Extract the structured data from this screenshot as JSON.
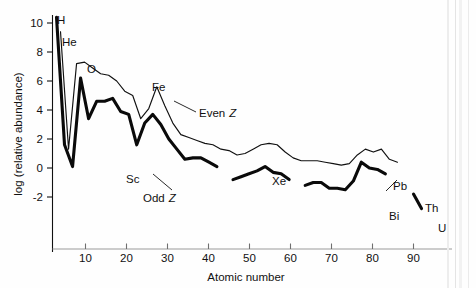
{
  "figure": {
    "name": "element-abundance-chart",
    "background_color": "#fefefe",
    "ink_color": "#111111"
  },
  "chart_data": {
    "type": "line",
    "title": "",
    "xlabel": "Atomic number",
    "ylabel": "log (relative abundance)",
    "xlim": [
      0,
      95
    ],
    "ylim": [
      -3.2,
      11.2
    ],
    "xticks": [
      10,
      20,
      30,
      40,
      50,
      60,
      70,
      80,
      90
    ],
    "xtick_labels": [
      "10",
      "20",
      "30",
      "40",
      "50",
      "60",
      "70",
      "80",
      "90"
    ],
    "yticks": [
      -2,
      0,
      2,
      4,
      6,
      8,
      10
    ],
    "ytick_labels": [
      "-2",
      "0",
      "2",
      "4",
      "6",
      "8",
      "10"
    ],
    "grid": false,
    "legend_position": "inline-annotations",
    "series": [
      {
        "name": "Even Z",
        "style": "thin",
        "points": [
          [
            2,
            9.4
          ],
          [
            4,
            1.3
          ],
          [
            6,
            7.2
          ],
          [
            8,
            7.3
          ],
          [
            10,
            6.9
          ],
          [
            12,
            6.5
          ],
          [
            14,
            6.4
          ],
          [
            16,
            6.0
          ],
          [
            18,
            5.3
          ],
          [
            20,
            5.0
          ],
          [
            22,
            3.4
          ],
          [
            24,
            4.1
          ],
          [
            26,
            5.6
          ],
          [
            28,
            4.3
          ],
          [
            30,
            3.1
          ],
          [
            32,
            2.3
          ],
          [
            34,
            2.1
          ],
          [
            36,
            1.9
          ],
          [
            38,
            1.7
          ],
          [
            40,
            1.6
          ],
          [
            42,
            1.3
          ],
          [
            44,
            1.2
          ],
          [
            46,
            0.9
          ],
          [
            48,
            1.0
          ],
          [
            50,
            1.3
          ],
          [
            52,
            1.6
          ],
          [
            54,
            1.7
          ],
          [
            56,
            1.6
          ],
          [
            58,
            1.1
          ],
          [
            60,
            0.7
          ],
          [
            62,
            0.5
          ],
          [
            64,
            0.5
          ],
          [
            66,
            0.5
          ],
          [
            68,
            0.4
          ],
          [
            70,
            0.3
          ],
          [
            72,
            0.2
          ],
          [
            74,
            0.3
          ],
          [
            76,
            0.9
          ],
          [
            78,
            1.3
          ],
          [
            80,
            1.1
          ],
          [
            82,
            1.3
          ],
          [
            84,
            0.6
          ],
          [
            86,
            0.4
          ]
        ]
      },
      {
        "name": "Odd Z",
        "style": "thick",
        "segments": [
          [
            [
              1,
              10.4
            ],
            [
              3,
              1.6
            ],
            [
              5,
              0.1
            ],
            [
              7,
              6.2
            ],
            [
              9,
              3.4
            ],
            [
              11,
              4.6
            ],
            [
              13,
              4.6
            ],
            [
              15,
              4.8
            ],
            [
              17,
              3.9
            ],
            [
              19,
              3.7
            ],
            [
              21,
              1.6
            ],
            [
              23,
              3.1
            ],
            [
              25,
              3.7
            ],
            [
              27,
              3.0
            ],
            [
              29,
              2.0
            ],
            [
              31,
              1.3
            ],
            [
              33,
              0.6
            ],
            [
              35,
              0.7
            ],
            [
              37,
              0.7
            ],
            [
              39,
              0.4
            ],
            [
              41,
              0.1
            ]
          ],
          [
            [
              45,
              -0.8
            ],
            [
              47,
              -0.6
            ],
            [
              49,
              -0.4
            ],
            [
              51,
              -0.2
            ],
            [
              53,
              0.1
            ],
            [
              55,
              -0.3
            ],
            [
              57,
              -0.4
            ],
            [
              59,
              -0.8
            ]
          ],
          [
            [
              63,
              -1.2
            ],
            [
              65,
              -1.0
            ],
            [
              67,
              -1.0
            ],
            [
              69,
              -1.4
            ],
            [
              71,
              -1.4
            ],
            [
              73,
              -1.5
            ],
            [
              75,
              -0.9
            ],
            [
              77,
              0.4
            ],
            [
              79,
              0.0
            ],
            [
              81,
              -0.1
            ],
            [
              83,
              -0.4
            ]
          ]
        ]
      },
      {
        "name": "Th-U",
        "style": "thick-short",
        "points": [
          [
            90,
            -1.8
          ],
          [
            92,
            -2.8
          ]
        ]
      }
    ],
    "annotations": [
      {
        "text": "H",
        "x": 1,
        "y": 11.0,
        "element": "hydrogen"
      },
      {
        "text": "He",
        "x": 3,
        "y": 9.6,
        "element": "helium"
      },
      {
        "text": "O",
        "x": 9,
        "y": 8.0,
        "element": "oxygen"
      },
      {
        "text": "Fe",
        "x": 25,
        "y": 6.6,
        "element": "iron"
      },
      {
        "text": "Sc",
        "x": 20,
        "y": 1.0,
        "element": "scandium"
      },
      {
        "text": "Xe",
        "x": 53,
        "y": 2.7,
        "element": "xenon"
      },
      {
        "text": "Pb",
        "x": 82,
        "y": 2.5,
        "element": "lead"
      },
      {
        "text": "Bi",
        "x": 85,
        "y": -1.1,
        "element": "bismuth"
      },
      {
        "text": "Th",
        "x": 88,
        "y": -1.2,
        "element": "thorium"
      },
      {
        "text": "U",
        "x": 93,
        "y": -2.8,
        "element": "uranium"
      },
      {
        "text": "Even",
        "italic": "Z",
        "x": 33,
        "y": 4.3,
        "element": "even-z-label"
      },
      {
        "text": "Odd",
        "italic": "Z",
        "x": 25,
        "y": 0.0,
        "element": "odd-z-label"
      }
    ]
  }
}
